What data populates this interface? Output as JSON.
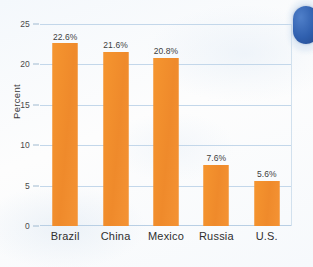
{
  "chart_data": {
    "type": "bar",
    "title": "",
    "xlabel": "",
    "ylabel": "Percent",
    "categories": [
      "Brazil",
      "China",
      "Mexico",
      "Russia",
      "U.S."
    ],
    "values": [
      22.6,
      21.6,
      20.8,
      7.6,
      5.6
    ],
    "value_labels": [
      "22.6%",
      "21.6%",
      "20.8%",
      "7.6%",
      "5.6%"
    ],
    "ylim": [
      0,
      25
    ],
    "yticks": [
      0,
      5,
      10,
      15,
      20,
      25
    ],
    "ytick_labels": [
      "0",
      "5",
      "10",
      "15",
      "20",
      "25"
    ],
    "grid": true,
    "legend": false,
    "series": [
      {
        "name": "Percent",
        "values": [
          22.6,
          21.6,
          20.8,
          7.6,
          5.6
        ]
      }
    ]
  },
  "style": {
    "bar_color": "#f18f31",
    "gridline_color": "#c3d7ea",
    "text_color": "#3d3d3d",
    "background_color": "#f7fafd",
    "accent_color": "#2f5fae"
  },
  "decoration": {
    "corner_tab_label": ""
  }
}
